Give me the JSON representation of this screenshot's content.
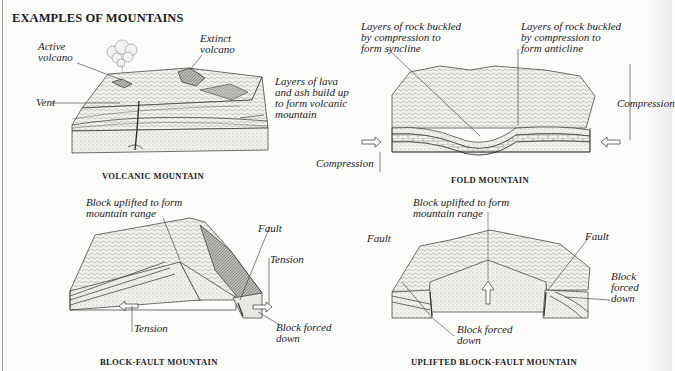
{
  "title": "EXAMPLES OF MOUNTAINS",
  "panels": {
    "volcanic": {
      "caption": "VOLCANIC MOUNTAIN",
      "labels": {
        "active_volcano": "Active\nvolcano",
        "extinct_volcano": "Extinct\nvolcano",
        "vent": "Vent",
        "layers": "Layers of lava\nand ash build up\nto form volcanic\nmountain"
      }
    },
    "fold": {
      "caption": "FOLD MOUNTAIN",
      "labels": {
        "syncline": "Layers of rock buckled\nby compression to\nform syncline",
        "anticline": "Layers of rock buckled\nby compression to\nform anticline",
        "compression_left": "Compression",
        "compression_right": "Compression"
      }
    },
    "block_fault": {
      "caption": "BLOCK-FAULT MOUNTAIN",
      "labels": {
        "uplifted": "Block uplifted to form\nmountain range",
        "fault": "Fault",
        "tension_right": "Tension",
        "tension_left": "Tension",
        "forced_down": "Block forced\ndown"
      }
    },
    "uplifted_block_fault": {
      "caption": "UPLIFTED BLOCK-FAULT MOUNTAIN",
      "labels": {
        "uplifted": "Block uplifted to form\nmountain range",
        "fault_left": "Fault",
        "fault_right": "Fault",
        "forced_down_right": "Block\nforced\ndown",
        "forced_down_bottom": "Block forced\ndown"
      }
    }
  }
}
